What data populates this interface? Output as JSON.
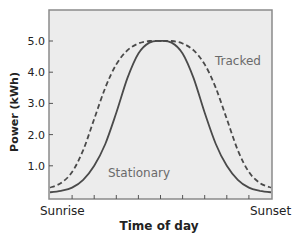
{
  "chart_data": {
    "type": "line",
    "title": "",
    "xlabel": "Time of day",
    "ylabel": "Power (kWh)",
    "x_tick_labels": [
      "Sunrise",
      "Sunset"
    ],
    "y_ticks": [
      1.0,
      2.0,
      3.0,
      4.0,
      5.0
    ],
    "y_tick_labels": [
      "1.0",
      "2.0",
      "3.0",
      "4.0",
      "5.0"
    ],
    "ylim": [
      0,
      6.0
    ],
    "xlim": [
      0,
      1
    ],
    "grid": false,
    "legend": "inline labels",
    "x": [
      0.0,
      0.05,
      0.1,
      0.15,
      0.2,
      0.25,
      0.3,
      0.35,
      0.4,
      0.45,
      0.5,
      0.55,
      0.6,
      0.65,
      0.7,
      0.75,
      0.8,
      0.85,
      0.9,
      0.95,
      1.0
    ],
    "series": [
      {
        "name": "Tracked",
        "style": "dashed",
        "values": [
          0.3,
          0.45,
          0.8,
          1.5,
          2.5,
          3.5,
          4.25,
          4.7,
          4.92,
          5.0,
          5.0,
          5.0,
          4.92,
          4.7,
          4.25,
          3.5,
          2.5,
          1.5,
          0.8,
          0.45,
          0.3
        ]
      },
      {
        "name": "Stationary",
        "style": "solid",
        "values": [
          0.15,
          0.2,
          0.3,
          0.55,
          1.0,
          1.7,
          2.7,
          3.8,
          4.6,
          4.95,
          5.0,
          4.95,
          4.6,
          3.8,
          2.7,
          1.7,
          1.0,
          0.55,
          0.3,
          0.2,
          0.15
        ]
      }
    ],
    "annotations": [
      {
        "text": "Tracked",
        "series": "Tracked"
      },
      {
        "text": "Stationary",
        "series": "Stationary"
      }
    ]
  },
  "colors": {
    "plot_bg": "#ececec",
    "frame": "#8a8a8a",
    "curve": "#4a4a4a",
    "label": "#6a6a6a",
    "text": "#222222"
  }
}
